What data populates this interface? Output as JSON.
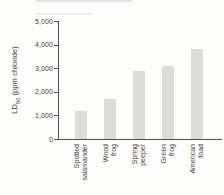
{
  "figure": {
    "background": "#fdfdfc"
  },
  "chart_data": {
    "type": "bar",
    "title": "",
    "xlabel": "",
    "ylabel": "LD50 (ppm chloride)",
    "ylabel_parts": {
      "prefix": "LD",
      "subscript": "50",
      "suffix": " (ppm chloride)"
    },
    "categories": [
      "Spotted salamander",
      "Wood frog",
      "Spring peeper",
      "Green frog",
      "American toad"
    ],
    "values": [
      1200,
      1700,
      2900,
      3100,
      3850
    ],
    "ylim": [
      0,
      5000
    ],
    "ytick_step": 1000,
    "ytick_labels": [
      "0",
      "1,000",
      "2,000",
      "3,000",
      "4,000",
      "5,000"
    ],
    "grid": "off",
    "legend": "none",
    "bar_color": "#dcdcd9",
    "axis_color": "#4f4f4f",
    "text_color": "#3d3d3d"
  }
}
